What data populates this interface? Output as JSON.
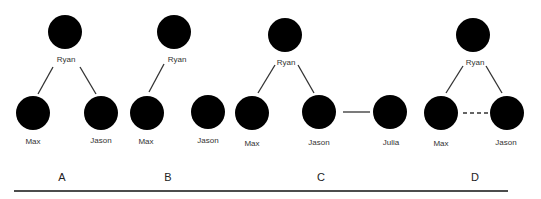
{
  "panels": [
    {
      "label": "A",
      "x": 62,
      "people": [
        {
          "name": "Ryan",
          "cx": 65,
          "cy": 32
        },
        {
          "name": "Max",
          "cx": 33,
          "cy": 113
        },
        {
          "name": "Jason",
          "cx": 101,
          "cy": 113
        }
      ],
      "edges": [
        {
          "from": "Ryan",
          "to": "Max",
          "style": "solid"
        },
        {
          "from": "Ryan",
          "to": "Jason",
          "style": "solid"
        }
      ]
    },
    {
      "label": "B",
      "x": 168,
      "people": [
        {
          "name": "Ryan",
          "cx": 174,
          "cy": 32
        },
        {
          "name": "Max",
          "cx": 147,
          "cy": 113
        },
        {
          "name": "Jason",
          "cx": 208,
          "cy": 112
        }
      ],
      "edges": [
        {
          "from": "Ryan",
          "to": "Max",
          "style": "solid"
        }
      ]
    },
    {
      "label": "C",
      "x": 310,
      "people": [
        {
          "name": "Ryan",
          "cx": 285,
          "cy": 35
        },
        {
          "name": "Max",
          "cx": 252,
          "cy": 113
        },
        {
          "name": "Jason",
          "cx": 319,
          "cy": 112
        },
        {
          "name": "Julia",
          "cx": 390,
          "cy": 112
        }
      ],
      "edges": [
        {
          "from": "Ryan",
          "to": "Max",
          "style": "solid"
        },
        {
          "from": "Ryan",
          "to": "Jason",
          "style": "solid"
        },
        {
          "from": "Jason",
          "to": "Julia",
          "style": "solid"
        }
      ]
    },
    {
      "label": "D",
      "x": 459,
      "people": [
        {
          "name": "Ryan",
          "cx": 473,
          "cy": 35
        },
        {
          "name": "Max",
          "cx": 441,
          "cy": 113
        },
        {
          "name": "Jason",
          "cx": 507,
          "cy": 113
        }
      ],
      "edges": [
        {
          "from": "Ryan",
          "to": "Max",
          "style": "solid"
        },
        {
          "from": "Ryan",
          "to": "Jason",
          "style": "solid"
        },
        {
          "from": "Max",
          "to": "Jason",
          "style": "dashed"
        }
      ]
    }
  ],
  "names": {
    "a_ryan": "Ryan",
    "a_max": "Max",
    "a_jason": "Jason",
    "b_ryan": "Ryan",
    "b_max": "Max",
    "b_jason": "Jason",
    "c_ryan": "Ryan",
    "c_max": "Max",
    "c_jason": "Jason",
    "c_julia": "Julia",
    "d_ryan": "Ryan",
    "d_max": "Max",
    "d_jason": "Jason"
  },
  "labels": {
    "a": "A",
    "b": "B",
    "c": "C",
    "d": "D"
  },
  "icon": "smiley-face-icon"
}
